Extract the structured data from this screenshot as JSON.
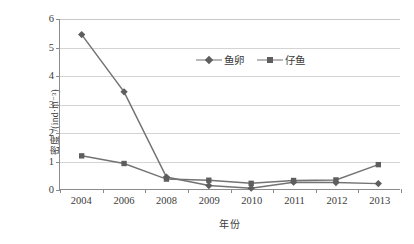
{
  "chart_data": {
    "type": "line",
    "title": "",
    "subtitle": "",
    "xlabel": "年份",
    "ylabel": "密度 /(ind·m⁻³)",
    "categories": [
      "2004",
      "2006",
      "2008",
      "2009",
      "2010",
      "2011",
      "2012",
      "2013"
    ],
    "ylim": [
      0,
      6
    ],
    "ytick_step": 1,
    "yticks": [
      "0",
      "1",
      "2",
      "3",
      "4",
      "5",
      "6"
    ],
    "grid": "horizontal",
    "legend_position": "upper-center",
    "series": [
      {
        "name": "鱼卵",
        "marker": "diamond",
        "color": "#5e5e5e",
        "values": [
          5.45,
          3.43,
          0.42,
          0.12,
          0.03,
          0.24,
          0.23,
          0.19
        ]
      },
      {
        "name": "仔鱼",
        "marker": "square",
        "color": "#5e5e5e",
        "values": [
          1.17,
          0.9,
          0.35,
          0.31,
          0.2,
          0.3,
          0.32,
          0.86
        ]
      }
    ]
  },
  "colors": {
    "line": "#737373",
    "marker": "#5e5e5e",
    "axis": "#8c8c8c",
    "grid": "#d4d4d4",
    "text": "#3b3b3b",
    "background": "#ffffff"
  }
}
